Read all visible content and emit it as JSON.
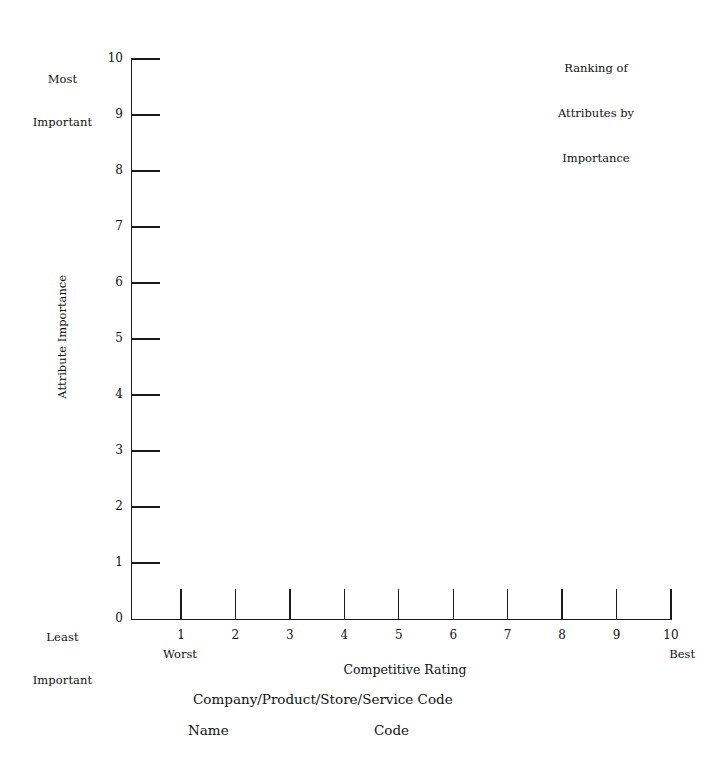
{
  "chart_data": {
    "type": "scatter",
    "title": "Ranking of Attributes by Importance",
    "title_lines": [
      "Ranking of",
      "Attributes by",
      "Importance"
    ],
    "xlabel": "Competitive Rating",
    "ylabel": "Attribute Importance",
    "xlim": [
      0,
      10
    ],
    "ylim": [
      0,
      10
    ],
    "x_ticks": [
      "1",
      "2",
      "3",
      "4",
      "5",
      "6",
      "7",
      "8",
      "9",
      "10"
    ],
    "y_ticks": [
      "0",
      "1",
      "2",
      "3",
      "4",
      "5",
      "6",
      "7",
      "8",
      "9",
      "10"
    ],
    "x_axis_endpoint_labels": {
      "left": "Worst",
      "right": "Best"
    },
    "y_axis_endpoint_labels": {
      "top_lines": [
        "Most",
        "Important"
      ],
      "bottom_lines": [
        "Least",
        "Important"
      ]
    },
    "grid": false,
    "legend": null,
    "series": [],
    "values": [],
    "note": "Blank worksheet grid — no data points plotted"
  },
  "axes": {
    "y_title": "Attribute Importance",
    "x_title": "Competitive Rating",
    "y_top_caption": [
      "Most",
      "Important"
    ],
    "y_bottom_caption": [
      "Least",
      "Important"
    ],
    "x_left_caption": "Worst",
    "x_right_caption": "Best"
  },
  "footer": {
    "code_heading": "Company/Product/Store/Service Code",
    "name_column": "Name",
    "code_column": "Code"
  },
  "colors": {
    "background": "#ffffff",
    "ink": "#111111",
    "axis": "#1a1a1a"
  }
}
